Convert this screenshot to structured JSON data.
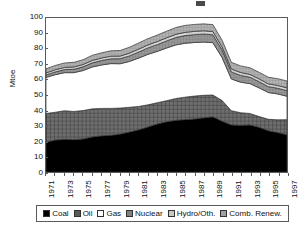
{
  "chart_data": {
    "type": "area",
    "stacked": true,
    "title": "",
    "xlabel": "",
    "ylabel": "Mtoe",
    "ylim": [
      0,
      100
    ],
    "ytick_values": [
      0,
      10,
      20,
      30,
      40,
      50,
      60,
      70,
      80,
      90,
      100
    ],
    "ytick_labels": [
      "0",
      "10",
      "20",
      "30",
      "40",
      "50",
      "60",
      "70",
      "80",
      "90",
      "100"
    ],
    "grid": false,
    "legend_position": "bottom",
    "x": [
      1971,
      1972,
      1973,
      1974,
      1975,
      1976,
      1977,
      1978,
      1979,
      1980,
      1981,
      1982,
      1983,
      1984,
      1985,
      1986,
      1987,
      1988,
      1989,
      1990,
      1991,
      1992,
      1993,
      1994,
      1995,
      1996,
      1997
    ],
    "xtick_labels": [
      "1971",
      "1973",
      "1975",
      "1977",
      "1979",
      "1981",
      "1983",
      "1985",
      "1987",
      "1989",
      "1991",
      "1993",
      "1995",
      "1997"
    ],
    "xtick_values": [
      1971,
      1973,
      1975,
      1977,
      1979,
      1981,
      1983,
      1985,
      1987,
      1989,
      1991,
      1993,
      1995,
      1997
    ],
    "series": [
      {
        "name": "Coal",
        "color": "#000000",
        "pattern": "solid",
        "values": [
          19.3,
          20.8,
          21.2,
          21.0,
          21.5,
          22.8,
          23.5,
          23.8,
          24.6,
          26.0,
          27.4,
          29.3,
          31.2,
          32.6,
          33.6,
          34.0,
          34.4,
          35.2,
          35.8,
          33.0,
          30.6,
          30.3,
          30.6,
          29.0,
          26.8,
          25.6,
          24.2
        ]
      },
      {
        "name": "Oil",
        "color": "#5a5a5a",
        "pattern": "cross-hatch",
        "values": [
          18.7,
          18.0,
          18.6,
          18.3,
          18.4,
          18.2,
          17.8,
          17.5,
          16.9,
          16.0,
          15.2,
          14.3,
          13.8,
          13.7,
          14.1,
          14.6,
          14.9,
          14.6,
          14.2,
          13.4,
          9.2,
          8.2,
          7.4,
          7.0,
          7.4,
          8.3,
          9.8
        ]
      },
      {
        "name": "Gas",
        "color": "#ffffff",
        "pattern": "none",
        "values": [
          23.4,
          24.4,
          24.7,
          25.2,
          26.0,
          27.2,
          28.2,
          29.1,
          28.8,
          29.8,
          31.4,
          32.8,
          33.3,
          34.2,
          34.8,
          35.0,
          34.8,
          34.6,
          34.0,
          27.9,
          20.6,
          19.8,
          19.4,
          18.6,
          17.4,
          16.8,
          15.2
        ]
      },
      {
        "name": "Nuclear",
        "color": "#808080",
        "pattern": "fine-grid",
        "values": [
          1.6,
          1.8,
          2.0,
          2.2,
          2.4,
          2.7,
          2.9,
          3.1,
          3.3,
          3.6,
          3.9,
          4.2,
          4.4,
          4.6,
          4.8,
          5.0,
          5.1,
          5.2,
          5.1,
          4.9,
          4.6,
          4.4,
          4.2,
          4.0,
          3.8,
          3.7,
          3.6
        ]
      },
      {
        "name": "Hydro/Oth.",
        "color": "#c8c8c8",
        "pattern": "light",
        "values": [
          1.3,
          1.4,
          1.4,
          1.5,
          1.5,
          1.6,
          1.6,
          1.7,
          1.7,
          1.8,
          1.9,
          1.9,
          2.0,
          2.0,
          2.1,
          2.1,
          2.1,
          2.1,
          2.1,
          2.0,
          1.9,
          1.9,
          1.8,
          1.8,
          1.8,
          1.8,
          1.8
        ]
      },
      {
        "name": "Comb. Renew.",
        "color": "#a0a0a0",
        "pattern": "medium",
        "values": [
          2.7,
          2.8,
          2.9,
          3.0,
          3.1,
          3.3,
          3.4,
          3.5,
          3.6,
          3.8,
          4.0,
          4.1,
          4.2,
          4.3,
          4.4,
          4.5,
          4.5,
          4.5,
          4.5,
          4.4,
          4.3,
          4.3,
          4.3,
          4.3,
          4.3,
          4.4,
          4.5
        ]
      }
    ],
    "totals": [
      67.0,
      69.2,
      70.8,
      71.2,
      72.9,
      75.8,
      77.4,
      78.7,
      78.9,
      81.0,
      83.8,
      86.6,
      88.9,
      91.4,
      93.8,
      95.2,
      95.8,
      96.2,
      95.7,
      85.6,
      71.2,
      68.9,
      67.7,
      64.7,
      61.5,
      60.6,
      59.1
    ]
  },
  "legend": {
    "items": [
      {
        "label": "Coal",
        "swatch": "sw-coal"
      },
      {
        "label": "Oil",
        "swatch": "sw-oil"
      },
      {
        "label": "Gas",
        "swatch": "sw-gas"
      },
      {
        "label": "Nuclear",
        "swatch": "sw-nuclear"
      },
      {
        "label": "Hydro/Oth.",
        "swatch": "sw-hydro"
      },
      {
        "label": "Comb. Renew.",
        "swatch": "sw-renew"
      }
    ]
  }
}
